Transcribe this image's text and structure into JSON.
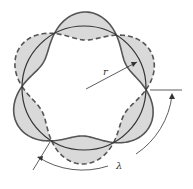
{
  "diagram": {
    "labels": {
      "radius": "r",
      "wavelength": "λ"
    },
    "circle": {
      "cx": 84,
      "cy": 88,
      "r": 62
    },
    "wave": {
      "nodes": 6,
      "amplitude": 14
    },
    "colors": {
      "stroke": "#555555",
      "fill": "#d9d9d9",
      "line": "#333333"
    }
  }
}
